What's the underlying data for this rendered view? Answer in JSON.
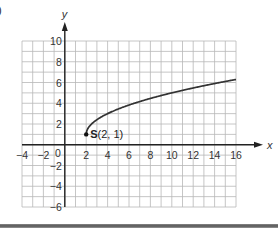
{
  "partial_label": ")",
  "chart_data": {
    "type": "line",
    "title": "",
    "xlabel": "x",
    "ylabel": "y",
    "xlim": [
      -4,
      16
    ],
    "ylim": [
      -6,
      10
    ],
    "grid": true,
    "grid_step": 1,
    "x_ticks": [
      -4,
      -2,
      0,
      2,
      4,
      6,
      8,
      10,
      12,
      14,
      16
    ],
    "y_ticks": [
      -6,
      -4,
      -2,
      2,
      4,
      6,
      8,
      10
    ],
    "origin_label": "0",
    "series": [
      {
        "name": "curve",
        "function": "y = 1 + sqrt(2(x - 2))",
        "x": [
          2,
          2.5,
          3,
          4,
          6,
          8,
          10,
          12,
          14,
          16
        ],
        "values": [
          1,
          2.0,
          2.41,
          3.0,
          3.83,
          4.46,
          5.0,
          5.47,
          5.9,
          6.29
        ]
      }
    ],
    "annotations": [
      {
        "label_bold": "S",
        "label_rest": "(2, 1)",
        "x": 2,
        "y": 1
      }
    ]
  }
}
